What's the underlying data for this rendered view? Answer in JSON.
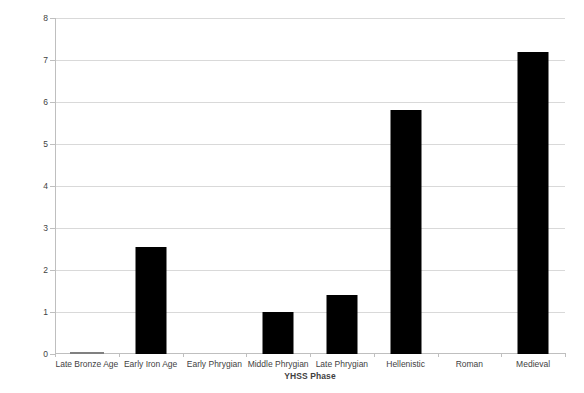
{
  "chart_data": {
    "type": "bar",
    "title": "",
    "xlabel": "YHSS Phase",
    "ylabel": "Ratio of bread to hard wheat (by count)",
    "categories": [
      "Late Bronze Age",
      "Early Iron Age",
      "Early Phrygian",
      "Middle Phrygian",
      "Late Phrygian",
      "Hellenistic",
      "Roman",
      "Medieval"
    ],
    "values": [
      0.03,
      2.55,
      0,
      1.0,
      1.4,
      5.8,
      0,
      7.2
    ],
    "ylim": [
      0,
      8
    ],
    "ytick_labels": [
      "0",
      "1",
      "2",
      "3",
      "4",
      "5",
      "6",
      "7",
      "8"
    ],
    "ytick_values": [
      0,
      1,
      2,
      3,
      4,
      5,
      6,
      7,
      8
    ],
    "grid": "horizontal",
    "legend": "none",
    "bar_color": "#000000",
    "grid_color": "#d9d9d9",
    "axis_color": "#bfbfbf",
    "text_color": "#3f3f3f"
  }
}
